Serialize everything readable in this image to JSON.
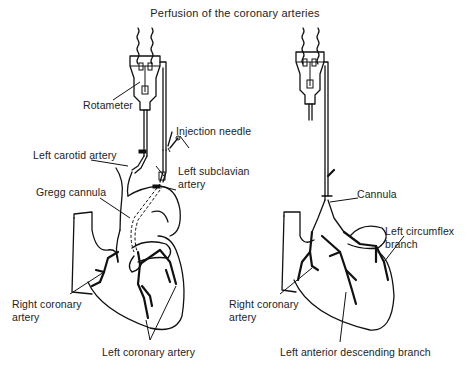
{
  "figure": {
    "title": "Perfusion of the coronary arteries"
  },
  "left_panel": {
    "labels": {
      "rotameter": "Rotameter",
      "injection_needle": "Injection needle",
      "left_carotid_artery": "Left carotid artery",
      "left_subclavian_line1": "Left subclavian",
      "left_subclavian_line2": "artery",
      "gregg_cannula": "Gregg cannula",
      "right_coronary_line1": "Right coronary",
      "right_coronary_line2": "artery",
      "left_coronary_artery": "Left coronary artery"
    }
  },
  "right_panel": {
    "labels": {
      "cannula": "Cannula",
      "left_circumflex_line1": "Left circumflex",
      "left_circumflex_line2": "branch",
      "right_coronary_line1": "Right coronary",
      "right_coronary_line2": "artery",
      "left_anterior_descending": "Left anterior descending branch"
    }
  },
  "colors": {
    "ink": "#111111",
    "background": "#ffffff"
  }
}
